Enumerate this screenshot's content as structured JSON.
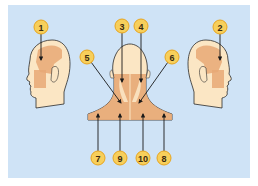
{
  "figure": {
    "colors": {
      "background": "#cfe3f6",
      "skin": "#fbe6c4",
      "muscle": "#e7a876",
      "muscle_dark": "#d99a68",
      "outline": "#2b2b2b",
      "badge_fill": "#f7cf5b",
      "badge_stroke": "#e8a51e",
      "arrow": "#1a1a1a"
    },
    "labels": [
      {
        "id": "1",
        "text": "1",
        "view": "left-profile-head",
        "cx": 41,
        "cy": 27
      },
      {
        "id": "2",
        "text": "2",
        "view": "right-profile-head",
        "cx": 220,
        "cy": 27
      },
      {
        "id": "3",
        "text": "3",
        "view": "back-of-neck",
        "cx": 122,
        "cy": 26
      },
      {
        "id": "4",
        "text": "4",
        "view": "back-of-neck",
        "cx": 141,
        "cy": 26
      },
      {
        "id": "5",
        "text": "5",
        "view": "back-of-neck",
        "cx": 87,
        "cy": 57
      },
      {
        "id": "6",
        "text": "6",
        "view": "back-of-neck",
        "cx": 172,
        "cy": 57
      },
      {
        "id": "7",
        "text": "7",
        "view": "shoulders",
        "cx": 98,
        "cy": 158
      },
      {
        "id": "9",
        "text": "9",
        "view": "shoulders",
        "cx": 120,
        "cy": 158
      },
      {
        "id": "10",
        "text": "10",
        "view": "shoulders",
        "cx": 143,
        "cy": 158
      },
      {
        "id": "8",
        "text": "8",
        "view": "shoulders",
        "cx": 164,
        "cy": 158
      }
    ]
  }
}
